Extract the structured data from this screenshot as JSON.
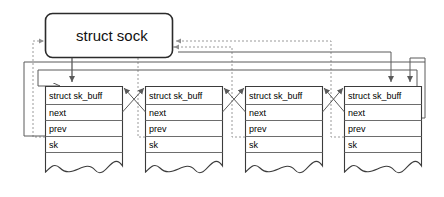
{
  "diagram": {
    "title_node": {
      "label": "struct sock",
      "name": "struct-sock-box"
    },
    "buffers": [
      {
        "header": "struct sk_buff",
        "fields": [
          "next",
          "prev",
          "sk"
        ]
      },
      {
        "header": "struct sk_buff",
        "fields": [
          "next",
          "prev",
          "sk"
        ]
      },
      {
        "header": "struct sk_buff",
        "fields": [
          "next",
          "prev",
          "sk"
        ]
      },
      {
        "header": "struct sk_buff",
        "fields": [
          "next",
          "prev",
          "sk"
        ]
      }
    ],
    "colors": {
      "background": "#ffffff",
      "box_stroke": "#3b3b3b",
      "solid_link": "#5a5a5a",
      "dashed_link": "#9a9a9a",
      "text": "#000000"
    }
  }
}
